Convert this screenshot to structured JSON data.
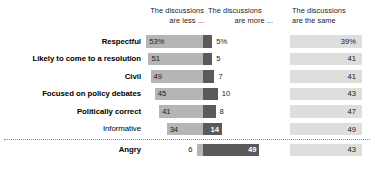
{
  "chart_data": {
    "type": "bar",
    "title": "",
    "subtitle": "",
    "xlabel": "",
    "ylabel": "",
    "grid": false,
    "legend_position": "top",
    "orientation": "horizontal",
    "layout": "diverging-paired",
    "axis_note": "left series right-aligned to a shared center axis; right series grows rightward from the same axis; third series in a separate right-hand column",
    "columns": [
      {
        "id": "less",
        "line1": "The discussions",
        "line2": "are less ..."
      },
      {
        "id": "more",
        "line1": "The discussions",
        "line2": "are more ..."
      },
      {
        "id": "same",
        "line1": "The discussions",
        "line2": "are the same"
      }
    ],
    "categories": [
      "Respectful",
      "Likely to come to a resolution",
      "Civil",
      "Focused on policy debates",
      "Politically correct",
      "Informative",
      "Angry"
    ],
    "series": [
      {
        "name": "The discussions are less ...",
        "values": [
          53,
          51,
          49,
          45,
          41,
          34,
          6
        ]
      },
      {
        "name": "The discussions are more ...",
        "values": [
          5,
          5,
          7,
          10,
          8,
          14,
          49
        ]
      },
      {
        "name": "The discussions are the same",
        "values": [
          39,
          41,
          41,
          43,
          47,
          49,
          43
        ]
      }
    ],
    "value_labels": {
      "less": [
        "53%",
        "51",
        "49",
        "45",
        "41",
        "34",
        "6"
      ],
      "more": [
        "5%",
        "5",
        "7",
        "10",
        "8",
        "14",
        "49"
      ],
      "same": [
        "39%",
        "41",
        "41",
        "43",
        "47",
        "49",
        "43"
      ]
    },
    "colors": {
      "less_bar": "#b5b5b5",
      "more_bar": "#5a5a5a",
      "same_bar": "#dededd",
      "label_text": "#000000",
      "value_text": "#1a1a1a",
      "value_text_inverse": "#ffffff",
      "separator": "#8d8d8d",
      "background": "#ffffff"
    },
    "style_flags": {
      "bold_categories": [
        true,
        true,
        true,
        true,
        true,
        false,
        true
      ],
      "inside_dark_bar_label": [
        false,
        false,
        false,
        false,
        false,
        true,
        true
      ],
      "separator_before_index": 6
    }
  }
}
